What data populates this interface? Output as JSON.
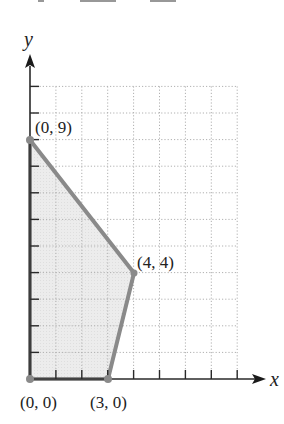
{
  "chart_data": {
    "type": "area",
    "title": "",
    "xlabel": "x",
    "ylabel": "y",
    "xlim": [
      0,
      8
    ],
    "ylim": [
      0,
      11
    ],
    "grid": true,
    "grid_style": "dotted",
    "x_ticks": [
      0,
      1,
      2,
      3,
      4,
      5,
      6,
      7,
      8
    ],
    "y_ticks": [
      0,
      1,
      2,
      3,
      4,
      5,
      6,
      7,
      8,
      9,
      10,
      11
    ],
    "feasible_region": {
      "vertices": [
        [
          0,
          0
        ],
        [
          0,
          9
        ],
        [
          4,
          4
        ],
        [
          3,
          0
        ]
      ],
      "fill": "#ececec",
      "edge": "#8a8a8a"
    },
    "points": [
      {
        "x": 0,
        "y": 0,
        "label": "(0, 0)"
      },
      {
        "x": 0,
        "y": 9,
        "label": "(0, 9)"
      },
      {
        "x": 4,
        "y": 4,
        "label": "(4, 4)"
      },
      {
        "x": 3,
        "y": 0,
        "label": "(3, 0)"
      }
    ],
    "annotations": [
      "(0, 0)",
      "(0, 9)",
      "(4, 4)",
      "(3, 0)"
    ]
  },
  "labels": {
    "x_axis": "x",
    "y_axis": "y",
    "p00": "(0, 0)",
    "p09": "(0, 9)",
    "p44": "(4, 4)",
    "p30": "(3, 0)"
  },
  "colors": {
    "axis": "#2a2a2a",
    "grid": "#b0b0b0",
    "region_fill": "#ececec",
    "region_edge": "#8a8a8a"
  }
}
